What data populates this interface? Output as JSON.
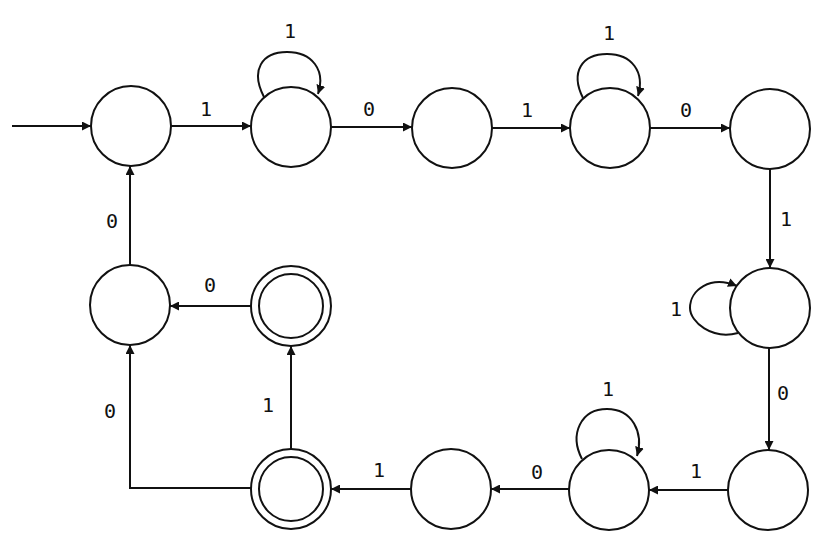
{
  "diagram": {
    "type": "finite-state-automaton",
    "colors": {
      "stroke": "#111111",
      "background": "#ffffff"
    },
    "states": [
      {
        "id": "A",
        "x": 131,
        "y": 126,
        "accepting": false,
        "initial": true
      },
      {
        "id": "B",
        "x": 291,
        "y": 127,
        "accepting": false
      },
      {
        "id": "C",
        "x": 452,
        "y": 128,
        "accepting": false
      },
      {
        "id": "D",
        "x": 610,
        "y": 128,
        "accepting": false
      },
      {
        "id": "E",
        "x": 770,
        "y": 129,
        "accepting": false
      },
      {
        "id": "F",
        "x": 770,
        "y": 308,
        "accepting": false
      },
      {
        "id": "G",
        "x": 768,
        "y": 490,
        "accepting": false
      },
      {
        "id": "H",
        "x": 609,
        "y": 490,
        "accepting": false
      },
      {
        "id": "I",
        "x": 451,
        "y": 489,
        "accepting": false
      },
      {
        "id": "J",
        "x": 291,
        "y": 489,
        "accepting": true
      },
      {
        "id": "K",
        "x": 291,
        "y": 306,
        "accepting": true
      },
      {
        "id": "L",
        "x": 130,
        "y": 305,
        "accepting": false
      }
    ],
    "transitions": [
      {
        "from": "A",
        "to": "B",
        "label": "1"
      },
      {
        "from": "B",
        "to": "B",
        "label": "1"
      },
      {
        "from": "B",
        "to": "C",
        "label": "0"
      },
      {
        "from": "C",
        "to": "D",
        "label": "1"
      },
      {
        "from": "D",
        "to": "D",
        "label": "1"
      },
      {
        "from": "D",
        "to": "E",
        "label": "0"
      },
      {
        "from": "E",
        "to": "F",
        "label": "1"
      },
      {
        "from": "F",
        "to": "F",
        "label": "1"
      },
      {
        "from": "F",
        "to": "G",
        "label": "0"
      },
      {
        "from": "G",
        "to": "H",
        "label": "1"
      },
      {
        "from": "H",
        "to": "H",
        "label": "1"
      },
      {
        "from": "H",
        "to": "I",
        "label": "0"
      },
      {
        "from": "I",
        "to": "J",
        "label": "1"
      },
      {
        "from": "J",
        "to": "K",
        "label": "1"
      },
      {
        "from": "J",
        "to": "L",
        "label": "0"
      },
      {
        "from": "K",
        "to": "L",
        "label": "0"
      },
      {
        "from": "L",
        "to": "A",
        "label": "0"
      }
    ],
    "labels": {
      "A_B": "1",
      "B_loop": "1",
      "B_C": "0",
      "C_D": "1",
      "D_loop": "1",
      "D_E": "0",
      "E_F": "1",
      "F_loop": "1",
      "F_G": "0",
      "G_H": "1",
      "H_loop": "1",
      "H_I": "0",
      "I_J": "1",
      "J_K": "1",
      "J_L": "0",
      "K_L": "0",
      "L_A": "0"
    }
  }
}
